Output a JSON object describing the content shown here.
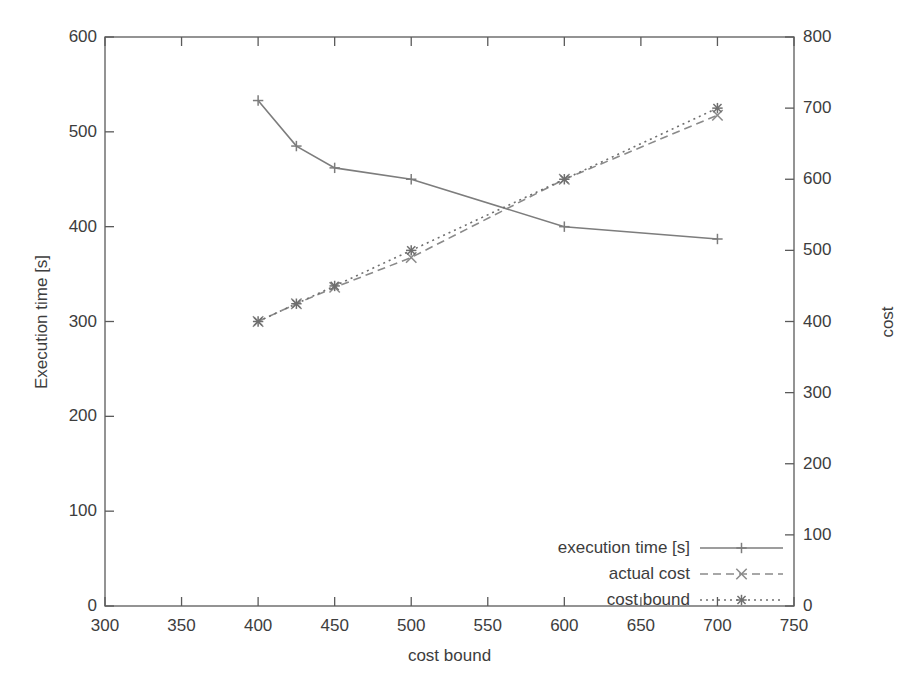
{
  "chart_data": {
    "type": "line",
    "title": "",
    "xlabel": "cost bound",
    "ylabel": "Execution time [s]",
    "ylabel_right": "cost",
    "xlim": [
      300,
      750
    ],
    "ylim": [
      0,
      600
    ],
    "ylim_right": [
      0,
      800
    ],
    "xticks": [
      300,
      350,
      400,
      450,
      500,
      550,
      600,
      650,
      700,
      750
    ],
    "yticks": [
      0,
      100,
      200,
      300,
      400,
      500,
      600
    ],
    "yticks_right": [
      0,
      100,
      200,
      300,
      400,
      500,
      600,
      700,
      800
    ],
    "grid": false,
    "legend_position": "bottom-right",
    "x": [
      400,
      425,
      450,
      500,
      600,
      700
    ],
    "series": [
      {
        "name": "execution time [s]",
        "axis": "left",
        "style": "solid",
        "marker": "plus",
        "color": "#7d7d7d",
        "values": [
          533,
          485,
          462,
          450,
          400,
          387
        ]
      },
      {
        "name": "actual cost",
        "axis": "right",
        "style": "dashed",
        "marker": "cross",
        "color": "#8a8a8a",
        "values": [
          400,
          425,
          448,
          490,
          600,
          690
        ]
      },
      {
        "name": "cost bound",
        "axis": "right",
        "style": "dotted",
        "marker": "star",
        "color": "#6f6f6f",
        "values": [
          400,
          425,
          450,
          500,
          600,
          700
        ]
      }
    ]
  },
  "axes": {
    "x_tick_labels": [
      "300",
      "350",
      "400",
      "450",
      "500",
      "550",
      "600",
      "650",
      "700",
      "750"
    ],
    "y_left_tick_labels": [
      "0",
      "100",
      "200",
      "300",
      "400",
      "500",
      "600"
    ],
    "y_right_tick_labels": [
      "0",
      "100",
      "200",
      "300",
      "400",
      "500",
      "600",
      "700",
      "800"
    ],
    "x_axis_title": "cost bound",
    "y_left_axis_title": "Execution time [s]",
    "y_right_axis_title": "cost"
  },
  "legend": {
    "items": [
      {
        "label": "execution time [s]"
      },
      {
        "label": "actual cost"
      },
      {
        "label": "cost bound"
      }
    ]
  }
}
